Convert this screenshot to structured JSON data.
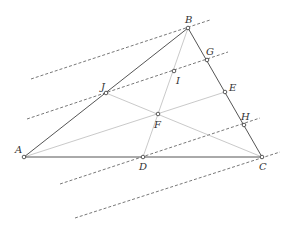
{
  "diagram": {
    "type": "geometry",
    "colors": {
      "triangle": "#555555",
      "median": "#bbbbbb",
      "dashed": "#555555",
      "point_fill": "#ffffff",
      "point_stroke": "#333333"
    },
    "points": [
      {
        "id": "A",
        "label": "A",
        "x": 24,
        "y": 157,
        "lx": -9,
        "ly": -4
      },
      {
        "id": "B",
        "label": "B",
        "x": 188,
        "y": 28,
        "lx": -3,
        "ly": -5
      },
      {
        "id": "C",
        "label": "C",
        "x": 262,
        "y": 157,
        "lx": -3,
        "ly": 13
      },
      {
        "id": "D",
        "label": "D",
        "x": 143,
        "y": 157,
        "lx": -4,
        "ly": 13
      },
      {
        "id": "E",
        "label": "E",
        "x": 225,
        "y": 92,
        "lx": 4,
        "ly": -1
      },
      {
        "id": "F",
        "label": "F",
        "x": 158,
        "y": 114,
        "lx": -4,
        "ly": 14
      },
      {
        "id": "G",
        "label": "G",
        "x": 207,
        "y": 60,
        "lx": -1,
        "ly": -5
      },
      {
        "id": "H",
        "label": "H",
        "x": 244,
        "y": 125,
        "lx": -3,
        "ly": -5
      },
      {
        "id": "I",
        "label": "I",
        "x": 174,
        "y": 71,
        "lx": 2,
        "ly": 13
      },
      {
        "id": "J",
        "label": "J",
        "x": 106,
        "y": 93,
        "lx": -5,
        "ly": -3
      }
    ],
    "triangle_edges": [
      [
        "A",
        "B"
      ],
      [
        "B",
        "C"
      ],
      [
        "C",
        "A"
      ]
    ],
    "medians": [
      [
        "A",
        "E"
      ],
      [
        "B",
        "D"
      ],
      [
        "C",
        "J"
      ]
    ],
    "dashed_lines": [
      {
        "name": "dashed-line-through-B",
        "from": [
          31,
          79
        ],
        "to": [
          210,
          20
        ]
      },
      {
        "name": "dashed-line-through-J-I-G",
        "from": [
          27,
          119
        ],
        "to": [
          228,
          52
        ]
      },
      {
        "name": "dashed-line-through-D-H",
        "from": [
          60,
          184
        ],
        "to": [
          260,
          118
        ]
      },
      {
        "name": "dashed-line-through-C",
        "from": [
          75,
          218
        ],
        "to": [
          280,
          152
        ]
      }
    ]
  }
}
